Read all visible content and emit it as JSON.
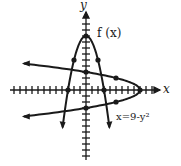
{
  "chart_data": {
    "type": "line",
    "title": "",
    "xlabel": "x",
    "ylabel": "y",
    "xlim": [
      -9,
      13
    ],
    "ylim": [
      -11,
      14
    ],
    "grid": false,
    "series": [
      {
        "name": "f(x)",
        "equation": "f(x) = 9 - x^2",
        "orientation": "vertical parabola opening down",
        "marked_points": [
          [
            -3,
            0
          ],
          [
            -2,
            5
          ],
          [
            0,
            9
          ],
          [
            2,
            5
          ],
          [
            3,
            0
          ]
        ]
      },
      {
        "name": "x=9-y^2",
        "equation": "x = 9 - y^2",
        "orientation": "horizontal parabola opening left",
        "marked_points": [
          [
            0,
            3
          ],
          [
            5,
            2
          ],
          [
            9,
            0
          ],
          [
            5,
            -2
          ],
          [
            0,
            -3
          ]
        ]
      }
    ],
    "annotations": [
      "f(x)",
      "x=9-y²"
    ]
  },
  "labels": {
    "y_axis": "y",
    "x_axis": "x",
    "f_label": "f (x)",
    "g_label": "x=9-y²"
  },
  "colors": {
    "ink": "#1a1a1a",
    "background": "#ffffff"
  }
}
